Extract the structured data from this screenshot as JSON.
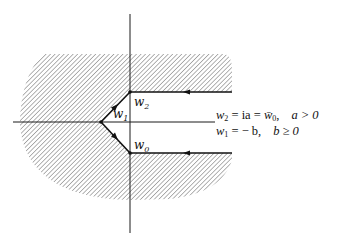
{
  "diagram": {
    "type": "complex-plane contour",
    "points": {
      "w2": {
        "label": "w",
        "sub": "2"
      },
      "w1": {
        "label": "w",
        "sub": "1"
      },
      "w0": {
        "label": "w",
        "sub": "0"
      }
    },
    "equations": [
      {
        "lhs_var": "w",
        "lhs_sub": "2",
        "rhs": "= ia = w̄",
        "rhs_sub": "0",
        "cond": "a > 0"
      },
      {
        "lhs_var": "w",
        "lhs_sub": "1",
        "rhs": "= − b,",
        "rhs_sub": "",
        "cond": "b ≥ 0"
      }
    ],
    "equation_line1": {
      "a": "w",
      "b": "2",
      "c": " = ia = ",
      "d": "w̄",
      "e": "0",
      "f": ",",
      "g": "a > 0"
    },
    "equation_line2": {
      "a": "w",
      "b": "1",
      "c": " = − b,",
      "g": "b ≥ 0"
    },
    "colors": {
      "ink": "#1a1a1a",
      "hatch": "#555555"
    }
  }
}
